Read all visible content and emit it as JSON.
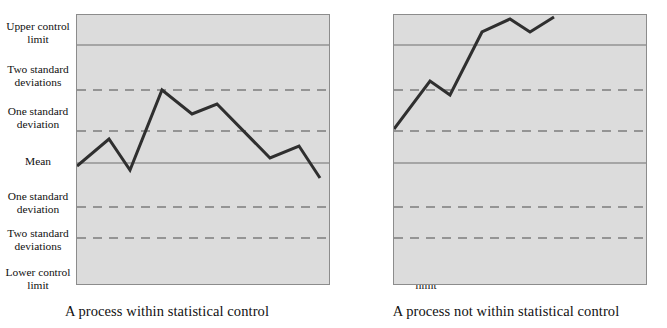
{
  "figure": {
    "type": "control-chart-pair",
    "background": "#ffffff",
    "plot_fill": "#dcdcdc",
    "plot_border": "#8c8c8c",
    "solid_line_color": "#6e6e6e",
    "dashed_line_color": "#7c7c7c",
    "series_color": "#2f2f2f"
  },
  "axis_labels": [
    {
      "text": "Upper control limit",
      "y": 20
    },
    {
      "text": "Two standard deviations",
      "y": 63
    },
    {
      "text": "One standard deviation",
      "y": 105
    },
    {
      "text": "Mean",
      "y": 155
    },
    {
      "text": "One standard deviation",
      "y": 190
    },
    {
      "text": "Two standard deviations",
      "y": 227
    },
    {
      "text": "Lower control limit",
      "y": 266
    }
  ],
  "panels": [
    {
      "id": "left",
      "caption": "A process within statistical control"
    },
    {
      "id": "right",
      "caption": "A process not within statistical control"
    }
  ],
  "chart_data": [
    {
      "type": "line",
      "title": "A process within statistical control",
      "xlabel": "",
      "ylabel": "",
      "grid": true,
      "legend": "none",
      "y_axis_categories": [
        "Upper control limit",
        "Two standard deviations",
        "One standard deviation",
        "Mean",
        "One standard deviation",
        "Two standard deviations",
        "Lower control limit"
      ],
      "reference_lines": [
        {
          "label": "Upper control limit",
          "style": "solid",
          "sigma": 3
        },
        {
          "label": "Two standard deviations",
          "style": "dashed",
          "sigma": 2
        },
        {
          "label": "One standard deviation",
          "style": "dashed",
          "sigma": 1
        },
        {
          "label": "Mean",
          "style": "solid",
          "sigma": 0
        },
        {
          "label": "One standard deviation",
          "style": "dashed",
          "sigma": -1
        },
        {
          "label": "Two standard deviations",
          "style": "dashed",
          "sigma": -2
        },
        {
          "label": "Lower control limit",
          "style": "solid",
          "sigma": -3
        }
      ],
      "ylim": [
        -3.6,
        3.6
      ],
      "x": [
        1,
        2,
        3,
        4,
        5,
        6,
        7,
        8,
        9,
        10
      ],
      "values_sigma": [
        -0.45,
        0.6,
        -0.2,
        2.2,
        1.55,
        1.85,
        0.5,
        0.2,
        0.65,
        -0.75
      ],
      "interpretation": "All points remain between the upper and lower control limits."
    },
    {
      "type": "line",
      "title": "A process not within statistical control",
      "xlabel": "",
      "ylabel": "",
      "grid": true,
      "legend": "none",
      "y_axis_categories": [
        "Upper control limit",
        "Two standard deviations",
        "One standard deviation",
        "Mean",
        "One standard deviation",
        "Two standard deviations",
        "Lower control limit"
      ],
      "reference_lines": [
        {
          "label": "Upper control limit",
          "style": "solid",
          "sigma": 3
        },
        {
          "label": "Two standard deviations",
          "style": "dashed",
          "sigma": 2
        },
        {
          "label": "One standard deviation",
          "style": "dashed",
          "sigma": 1
        },
        {
          "label": "Mean",
          "style": "solid",
          "sigma": 0
        },
        {
          "label": "One standard deviation",
          "style": "dashed",
          "sigma": -1
        },
        {
          "label": "Two standard deviations",
          "style": "dashed",
          "sigma": -2
        },
        {
          "label": "Lower control limit",
          "style": "solid",
          "sigma": -3
        }
      ],
      "ylim": [
        -3.6,
        3.6
      ],
      "x": [
        1,
        2,
        3,
        4,
        5,
        6,
        7,
        8,
        9
      ],
      "values_sigma": [
        1.0,
        2.35,
        2.0,
        3.25,
        3.6,
        3.45,
        3.75
      ],
      "interpretation": "Points drift upward and cross the upper control limit."
    }
  ],
  "geometry": {
    "plot": {
      "width": 254,
      "height": 271
    },
    "line_y": {
      "ucl": 30,
      "two_sd_upper": 75,
      "one_sd_upper": 116,
      "mean": 148,
      "one_sd_lower": 192,
      "two_sd_lower": 223
    },
    "left_points": "0,151 32,124 53,155 85,75 115,99 140,89 193,143 222,131 243,163",
    "right_points": "0,114 36,66 56,80 88,17 116,4 136,17 160,2"
  }
}
